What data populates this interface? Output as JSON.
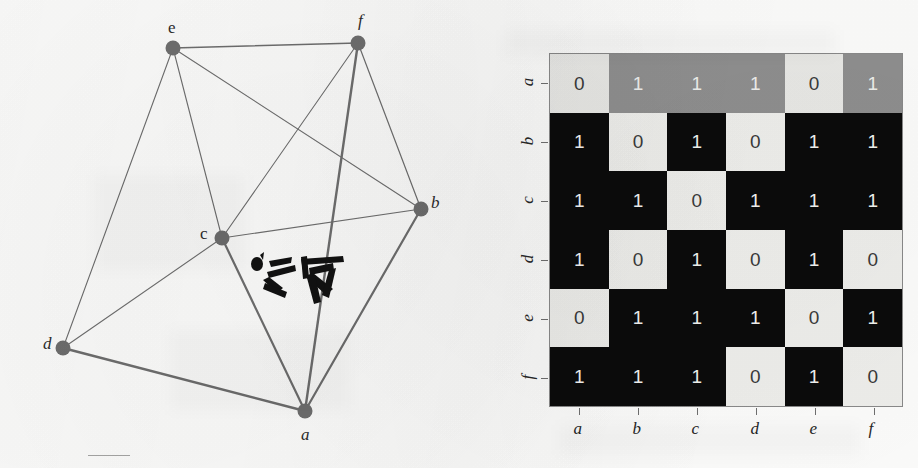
{
  "figure": {
    "type": "graph-and-adjacency-matrix",
    "background_color": "#fdfdfc"
  },
  "graph": {
    "title": "undirected graph",
    "node_color": "#6e6e6e",
    "edge_color": "#6e6e6e",
    "nodes": [
      {
        "id": "a",
        "label": "a",
        "x": 305,
        "y": 411,
        "label_dx": -4,
        "label_dy": 14,
        "italic": true
      },
      {
        "id": "b",
        "label": "b",
        "x": 421,
        "y": 209,
        "label_dx": 10,
        "label_dy": -16,
        "italic": true
      },
      {
        "id": "c",
        "label": "c",
        "x": 222,
        "y": 238,
        "label_dx": -22,
        "label_dy": -14,
        "italic": false
      },
      {
        "id": "d",
        "label": "d",
        "x": 63,
        "y": 348,
        "label_dx": -20,
        "label_dy": -14,
        "italic": true
      },
      {
        "id": "e",
        "label": "e",
        "x": 173,
        "y": 48,
        "label_dx": -5,
        "label_dy": -30,
        "italic": false
      },
      {
        "id": "f",
        "label": "f",
        "x": 358,
        "y": 43,
        "label_dx": 0,
        "label_dy": -32,
        "italic": true
      }
    ],
    "edges": [
      {
        "from": "a",
        "to": "b",
        "weight": 2.2
      },
      {
        "from": "a",
        "to": "c",
        "weight": 2.2
      },
      {
        "from": "a",
        "to": "d",
        "weight": 2.4
      },
      {
        "from": "a",
        "to": "f",
        "weight": 2.4
      },
      {
        "from": "b",
        "to": "c",
        "weight": 1.1
      },
      {
        "from": "b",
        "to": "e",
        "weight": 1.1
      },
      {
        "from": "b",
        "to": "f",
        "weight": 1.2
      },
      {
        "from": "c",
        "to": "d",
        "weight": 1.1
      },
      {
        "from": "c",
        "to": "e",
        "weight": 1.1
      },
      {
        "from": "c",
        "to": "f",
        "weight": 1.1
      },
      {
        "from": "d",
        "to": "e",
        "weight": 1.1
      },
      {
        "from": "e",
        "to": "f",
        "weight": 1.6
      }
    ],
    "annotation": {
      "name": "handwritten-scribble",
      "x": 247,
      "y": 248
    }
  },
  "matrix": {
    "title": "adjacency matrix",
    "row_labels": [
      "a",
      "b",
      "c",
      "d",
      "e",
      "f"
    ],
    "column_labels": [
      "a",
      "b",
      "c",
      "d",
      "e",
      "f"
    ],
    "highlight_row_index": 0,
    "colors": {
      "one": "#0b0b0b",
      "zero": "#efefec",
      "highlight_one": "#8f8f8f",
      "highlight_zero": "#e9e9e6",
      "one_text": "#f3f3f0",
      "zero_text": "#3a3a3a"
    },
    "rows": [
      {
        "label": "a",
        "values": [
          "0",
          "1",
          "1",
          "1",
          "0",
          "1"
        ]
      },
      {
        "label": "b",
        "values": [
          "1",
          "0",
          "1",
          "0",
          "1",
          "1"
        ]
      },
      {
        "label": "c",
        "values": [
          "1",
          "1",
          "0",
          "1",
          "1",
          "1"
        ]
      },
      {
        "label": "d",
        "values": [
          "1",
          "0",
          "1",
          "0",
          "1",
          "0"
        ]
      },
      {
        "label": "e",
        "values": [
          "0",
          "1",
          "1",
          "1",
          "0",
          "1"
        ]
      },
      {
        "label": "f",
        "values": [
          "1",
          "1",
          "1",
          "0",
          "1",
          "0"
        ]
      }
    ]
  },
  "chart_data": {
    "type": "heatmap",
    "xlabel": "",
    "ylabel": "",
    "categories": [
      "a",
      "b",
      "c",
      "d",
      "e",
      "f"
    ],
    "row_categories": [
      "a",
      "b",
      "c",
      "d",
      "e",
      "f"
    ],
    "column_categories": [
      "a",
      "b",
      "c",
      "d",
      "e",
      "f"
    ],
    "values": [
      [
        0,
        1,
        1,
        1,
        0,
        1
      ],
      [
        1,
        0,
        1,
        0,
        1,
        1
      ],
      [
        1,
        1,
        0,
        1,
        1,
        1
      ],
      [
        1,
        0,
        1,
        0,
        1,
        0
      ],
      [
        0,
        1,
        1,
        1,
        0,
        1
      ],
      [
        1,
        1,
        1,
        0,
        1,
        0
      ]
    ],
    "value_labels": true,
    "grid": false,
    "legend": "none",
    "colorscale": [
      {
        "value": 0,
        "color": "#efefec"
      },
      {
        "value": 1,
        "color": "#0b0b0b"
      }
    ],
    "highlighted_rows": [
      "a"
    ],
    "edges": [
      [
        "a",
        "b"
      ],
      [
        "a",
        "c"
      ],
      [
        "a",
        "d"
      ],
      [
        "a",
        "f"
      ],
      [
        "b",
        "c"
      ],
      [
        "b",
        "e"
      ],
      [
        "b",
        "f"
      ],
      [
        "c",
        "d"
      ],
      [
        "c",
        "e"
      ],
      [
        "c",
        "f"
      ],
      [
        "d",
        "e"
      ],
      [
        "e",
        "f"
      ]
    ]
  }
}
